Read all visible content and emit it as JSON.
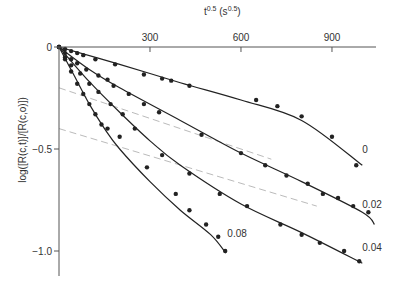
{
  "chart_data": {
    "type": "scatter",
    "title": "",
    "xlabel": "t^0.5 (s^0.5)",
    "xlabel_main": "t",
    "xlabel_sup1": "0.5",
    "xlabel_mid": " (s",
    "xlabel_sup2": "0.5",
    "xlabel_end": ")",
    "ylabel": "log([R(c,t)]/[R(c,o)])",
    "xlim": [
      0,
      1050
    ],
    "ylim": [
      -1.15,
      0
    ],
    "x_ticks": [
      300,
      600,
      900
    ],
    "x_tick_labels": [
      "300",
      "600",
      "900"
    ],
    "y_ticks": [
      0,
      -0.5,
      -1.0
    ],
    "y_tick_labels": [
      "0",
      "−0.5",
      "−1.0"
    ],
    "x_axis_position": "top",
    "grid": false,
    "series": [
      {
        "name": "0",
        "label_pos": [
          1000,
          -0.52
        ],
        "points": [
          [
            0,
            0
          ],
          [
            20,
            -0.01
          ],
          [
            40,
            -0.02
          ],
          [
            60,
            -0.03
          ],
          [
            80,
            -0.04
          ],
          [
            120,
            -0.06
          ],
          [
            185,
            -0.085
          ],
          [
            280,
            -0.135
          ],
          [
            340,
            -0.155
          ],
          [
            370,
            -0.165
          ],
          [
            430,
            -0.19
          ],
          [
            650,
            -0.26
          ],
          [
            720,
            -0.29
          ],
          [
            800,
            -0.34
          ],
          [
            900,
            -0.44
          ],
          [
            980,
            -0.58
          ]
        ],
        "fit": [
          [
            0,
            0
          ],
          [
            200,
            -0.085
          ],
          [
            400,
            -0.175
          ],
          [
            600,
            -0.26
          ],
          [
            800,
            -0.36
          ],
          [
            1000,
            -0.58
          ]
        ]
      },
      {
        "name": "0.02",
        "label_pos": [
          1000,
          -0.79
        ],
        "points": [
          [
            0,
            0
          ],
          [
            20,
            -0.03
          ],
          [
            40,
            -0.06
          ],
          [
            60,
            -0.08
          ],
          [
            90,
            -0.11
          ],
          [
            130,
            -0.14
          ],
          [
            160,
            -0.16
          ],
          [
            180,
            -0.19
          ],
          [
            230,
            -0.23
          ],
          [
            280,
            -0.28
          ],
          [
            330,
            -0.32
          ],
          [
            470,
            -0.43
          ],
          [
            600,
            -0.52
          ],
          [
            680,
            -0.58
          ],
          [
            750,
            -0.63
          ],
          [
            820,
            -0.67
          ],
          [
            870,
            -0.72
          ],
          [
            920,
            -0.74
          ],
          [
            970,
            -0.78
          ],
          [
            1020,
            -0.81
          ]
        ],
        "fit": [
          [
            0,
            0
          ],
          [
            100,
            -0.11
          ],
          [
            200,
            -0.2
          ],
          [
            400,
            -0.36
          ],
          [
            600,
            -0.52
          ],
          [
            800,
            -0.66
          ],
          [
            1000,
            -0.81
          ],
          [
            1040,
            -0.87
          ]
        ]
      },
      {
        "name": "0.04",
        "label_pos": [
          1000,
          -1.0
        ],
        "points": [
          [
            0,
            0
          ],
          [
            20,
            -0.05
          ],
          [
            40,
            -0.09
          ],
          [
            70,
            -0.13
          ],
          [
            100,
            -0.18
          ],
          [
            130,
            -0.22
          ],
          [
            170,
            -0.28
          ],
          [
            210,
            -0.33
          ],
          [
            250,
            -0.4
          ],
          [
            340,
            -0.53
          ],
          [
            430,
            -0.62
          ],
          [
            530,
            -0.72
          ],
          [
            620,
            -0.78
          ],
          [
            730,
            -0.87
          ],
          [
            800,
            -0.92
          ],
          [
            860,
            -0.96
          ],
          [
            940,
            -1.0
          ],
          [
            990,
            -1.05
          ]
        ],
        "fit": [
          [
            0,
            0
          ],
          [
            100,
            -0.17
          ],
          [
            200,
            -0.32
          ],
          [
            300,
            -0.46
          ],
          [
            400,
            -0.58
          ],
          [
            600,
            -0.77
          ],
          [
            800,
            -0.91
          ],
          [
            1000,
            -1.06
          ]
        ]
      },
      {
        "name": "0.08",
        "label_pos": [
          555,
          -0.93
        ],
        "points": [
          [
            0,
            0
          ],
          [
            20,
            -0.06
          ],
          [
            40,
            -0.12
          ],
          [
            60,
            -0.18
          ],
          [
            80,
            -0.23
          ],
          [
            100,
            -0.28
          ],
          [
            120,
            -0.33
          ],
          [
            140,
            -0.38
          ],
          [
            160,
            -0.4
          ],
          [
            200,
            -0.44
          ],
          [
            290,
            -0.59
          ],
          [
            385,
            -0.72
          ],
          [
            430,
            -0.8
          ],
          [
            485,
            -0.87
          ],
          [
            525,
            -0.93
          ],
          [
            548,
            -1.0
          ]
        ],
        "fit": [
          [
            0,
            0
          ],
          [
            50,
            -0.14
          ],
          [
            100,
            -0.28
          ],
          [
            150,
            -0.4
          ],
          [
            200,
            -0.5
          ],
          [
            300,
            -0.66
          ],
          [
            400,
            -0.8
          ],
          [
            500,
            -0.92
          ],
          [
            550,
            -1.01
          ]
        ]
      }
    ],
    "reference_lines": [
      {
        "name": "dashed-upper",
        "style": "dashed",
        "points": [
          [
            0,
            -0.2
          ],
          [
            700,
            -0.55
          ]
        ]
      },
      {
        "name": "dashed-lower",
        "style": "dashed",
        "points": [
          [
            0,
            -0.4
          ],
          [
            850,
            -0.78
          ]
        ]
      }
    ]
  },
  "colors": {
    "axis": "#555555",
    "line": "#222222",
    "marker": "#222222",
    "dashed": "#bbbbbb",
    "text": "#333333"
  }
}
